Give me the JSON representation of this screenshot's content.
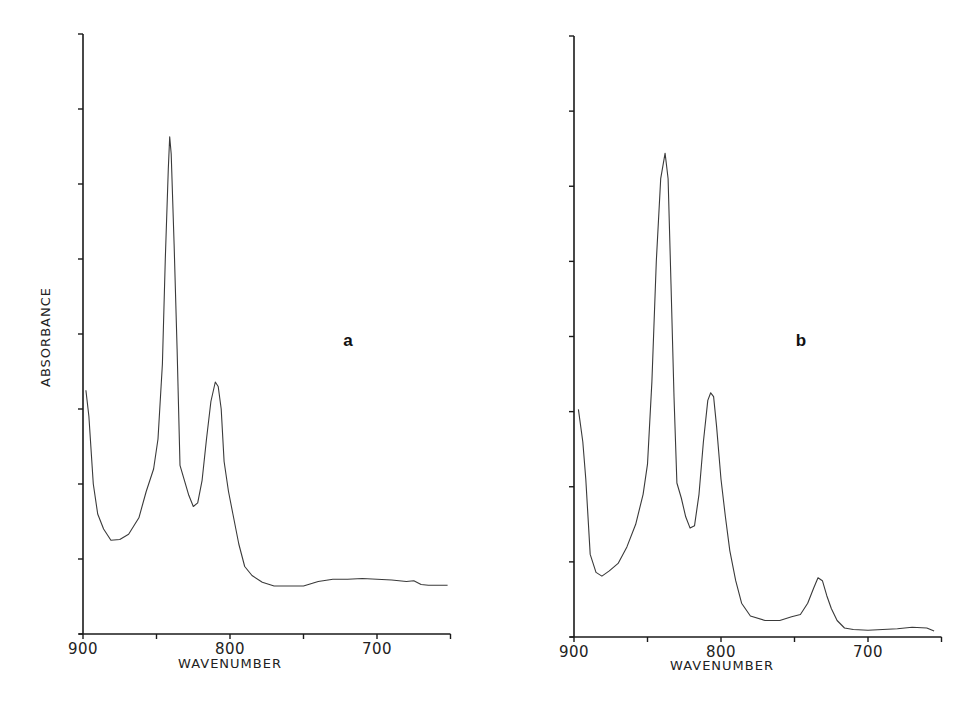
{
  "figure": {
    "ylabel": "ABSORBANCE",
    "xlabel": "WAVENUMBER"
  },
  "chart_data": [
    {
      "type": "line",
      "panel_label": "a",
      "title": "",
      "xlabel": "WAVENUMBER",
      "ylabel": "ABSORBANCE",
      "xlim": [
        900,
        650
      ],
      "x_reversed": true,
      "ylim": [
        0,
        8
      ],
      "xticks": [
        900,
        850,
        800,
        750,
        700,
        650
      ],
      "xtick_labels": [
        "900",
        "800",
        "700"
      ],
      "xtick_label_values": [
        900,
        800,
        700
      ],
      "yticks": [
        0,
        1,
        2,
        3,
        4,
        5,
        6,
        7,
        8
      ],
      "ytick_labels": [],
      "grid": false,
      "legend": null,
      "series": [
        {
          "name": "spectrum a",
          "x": [
            898,
            896,
            893,
            890,
            886,
            881,
            875,
            869,
            862,
            857,
            852,
            849,
            846,
            844,
            842,
            841,
            840,
            838,
            836,
            834,
            831,
            828,
            825,
            822,
            819,
            816,
            813,
            810,
            808,
            806,
            804,
            801,
            798,
            794,
            790,
            785,
            778,
            770,
            760,
            750,
            740,
            730,
            720,
            710,
            700,
            690,
            680,
            675,
            670,
            665,
            660,
            652
          ],
          "y": [
            3.25,
            2.9,
            2.0,
            1.6,
            1.4,
            1.25,
            1.26,
            1.33,
            1.55,
            1.9,
            2.2,
            2.6,
            3.6,
            5.0,
            6.2,
            6.63,
            6.4,
            5.2,
            3.8,
            2.25,
            2.05,
            1.85,
            1.7,
            1.75,
            2.05,
            2.6,
            3.1,
            3.36,
            3.3,
            3.0,
            2.3,
            1.9,
            1.6,
            1.2,
            0.9,
            0.78,
            0.69,
            0.64,
            0.64,
            0.64,
            0.7,
            0.73,
            0.73,
            0.74,
            0.73,
            0.72,
            0.7,
            0.71,
            0.66,
            0.65,
            0.65,
            0.65
          ]
        }
      ],
      "peaks": [
        {
          "x": 898,
          "y": 3.25
        },
        {
          "x": 841,
          "y": 6.63
        },
        {
          "x": 808,
          "y": 3.36
        }
      ]
    },
    {
      "type": "line",
      "panel_label": "b",
      "title": "",
      "xlabel": "WAVENUMBER",
      "ylabel": "",
      "xlim": [
        900,
        650
      ],
      "x_reversed": true,
      "ylim": [
        0,
        8
      ],
      "xticks": [
        900,
        850,
        800,
        750,
        700,
        650
      ],
      "xtick_labels": [
        "900",
        "800",
        "700"
      ],
      "xtick_label_values": [
        900,
        800,
        700
      ],
      "yticks": [
        0,
        1,
        2,
        3,
        4,
        5,
        6,
        7,
        8
      ],
      "ytick_labels": [],
      "grid": false,
      "legend": null,
      "series": [
        {
          "name": "spectrum b",
          "x": [
            897,
            894,
            892,
            889,
            885,
            881,
            876,
            870,
            864,
            858,
            853,
            850,
            847,
            844,
            841,
            838,
            836,
            834,
            832,
            830,
            827,
            824,
            821,
            818,
            815,
            812,
            809,
            807,
            805,
            803,
            800,
            797,
            794,
            790,
            786,
            780,
            770,
            760,
            752,
            746,
            741,
            737,
            734,
            731,
            728,
            725,
            721,
            716,
            710,
            700,
            690,
            680,
            670,
            660,
            655
          ],
          "y": [
            3.03,
            2.6,
            2.1,
            1.1,
            0.86,
            0.81,
            0.88,
            0.98,
            1.2,
            1.5,
            1.9,
            2.3,
            3.4,
            5.0,
            6.1,
            6.44,
            6.1,
            4.7,
            3.2,
            2.05,
            1.85,
            1.6,
            1.45,
            1.48,
            1.9,
            2.6,
            3.15,
            3.25,
            3.2,
            2.8,
            2.1,
            1.6,
            1.15,
            0.75,
            0.45,
            0.28,
            0.22,
            0.22,
            0.27,
            0.3,
            0.45,
            0.65,
            0.79,
            0.75,
            0.55,
            0.38,
            0.22,
            0.12,
            0.1,
            0.09,
            0.1,
            0.11,
            0.13,
            0.12,
            0.08
          ]
        }
      ],
      "peaks": [
        {
          "x": 897,
          "y": 3.03
        },
        {
          "x": 838,
          "y": 6.44
        },
        {
          "x": 807,
          "y": 3.25
        },
        {
          "x": 734,
          "y": 0.79
        }
      ]
    }
  ],
  "layout": {
    "panels": [
      {
        "x0": 83,
        "x_per_unit": 1.47,
        "y_axis": 634,
        "y_top": 34,
        "label_x": 348,
        "label_y": 346
      },
      {
        "x0": 574,
        "x_per_unit": 1.47,
        "y_axis": 637,
        "y_top": 36,
        "label_x": 801,
        "label_y": 346
      }
    ]
  }
}
